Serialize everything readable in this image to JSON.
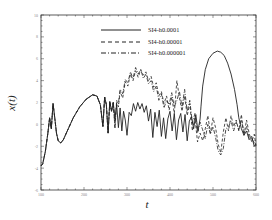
{
  "chart_data": {
    "type": "line",
    "title": "",
    "xlabel": "t",
    "ylabel": "x(t)",
    "xlim": [
      100,
      600
    ],
    "ylim": [
      -6,
      10
    ],
    "xticks": [
      100,
      200,
      300,
      400,
      500,
      600
    ],
    "yticks": [
      -6,
      -4,
      -2,
      0,
      2,
      4,
      6,
      8,
      10
    ],
    "grid": false,
    "legend_position": "upper center",
    "series": [
      {
        "name": "SI4-h0.0001",
        "style": "solid",
        "x": [
          100,
          104,
          110,
          116,
          120,
          124,
          128,
          132,
          136,
          140,
          146,
          152,
          160,
          175,
          190,
          205,
          220,
          230,
          238,
          244,
          248,
          252,
          256,
          260,
          264,
          268,
          272,
          276,
          280,
          284,
          288,
          292,
          296,
          300,
          305,
          310,
          315,
          320,
          325,
          330,
          335,
          340,
          345,
          350,
          355,
          360,
          365,
          370,
          375,
          380,
          385,
          390,
          395,
          400,
          405,
          410,
          415,
          420,
          425,
          430,
          435,
          440,
          445,
          450,
          455,
          460,
          465,
          470,
          472,
          476,
          482,
          490,
          500,
          510,
          518,
          526,
          534,
          542,
          550,
          556,
          560,
          566,
          572,
          578,
          584,
          590,
          596,
          600
        ],
        "y": [
          -3.8,
          -3.6,
          -2.5,
          -0.8,
          0.6,
          -0.4,
          1.9,
          0.6,
          -0.8,
          -1.5,
          -1.7,
          -1.4,
          -0.7,
          0.6,
          1.6,
          2.3,
          2.7,
          2.6,
          1.8,
          -0.2,
          2.5,
          1.8,
          -0.8,
          2.1,
          1.2,
          2.0,
          0.5,
          1.8,
          -0.3,
          1.5,
          -0.6,
          1.2,
          0.4,
          -1.0,
          1.1,
          0.8,
          1.9,
          1.2,
          2.0,
          1.4,
          1.9,
          1.1,
          1.7,
          0.3,
          1.4,
          -1.2,
          1.1,
          -0.2,
          1.3,
          -1.1,
          0.6,
          -1.3,
          0.5,
          1.2,
          -0.6,
          1.0,
          -1.4,
          0.4,
          1.0,
          -0.7,
          0.9,
          -1.5,
          0.3,
          0.7,
          -0.4,
          0.9,
          -0.6,
          0.5,
          1.6,
          3.5,
          5.0,
          6.0,
          6.5,
          6.7,
          6.6,
          6.3,
          5.6,
          4.6,
          3.2,
          1.8,
          0.6,
          -0.4,
          -1.0,
          -0.6,
          -1.4,
          -1.1,
          -2.0,
          -1.8
        ]
      },
      {
        "name": "SI4-h0.00001",
        "style": "dashed",
        "x": [
          100,
          104,
          110,
          116,
          120,
          124,
          128,
          132,
          136,
          140,
          146,
          152,
          160,
          175,
          190,
          205,
          220,
          230,
          238,
          244,
          248,
          252,
          256,
          260,
          264,
          268,
          272,
          276,
          280,
          284,
          290,
          296,
          302,
          308,
          314,
          320,
          326,
          332,
          338,
          344,
          350,
          356,
          362,
          368,
          374,
          380,
          386,
          392,
          398,
          404,
          410,
          416,
          422,
          428,
          434,
          440,
          446,
          452,
          458,
          464,
          470,
          476,
          482,
          488,
          494,
          500,
          506,
          512,
          518,
          524,
          530,
          536,
          542,
          548,
          554,
          560,
          566,
          572,
          578,
          584,
          590,
          596,
          600
        ],
        "y": [
          -3.8,
          -3.6,
          -2.5,
          -0.8,
          0.6,
          -0.4,
          1.9,
          0.6,
          -0.8,
          -1.5,
          -1.7,
          -1.4,
          -0.7,
          0.6,
          1.6,
          2.3,
          2.7,
          2.6,
          1.8,
          -0.2,
          2.5,
          1.8,
          -0.8,
          2.1,
          1.2,
          2.0,
          -0.3,
          2.2,
          1.6,
          3.0,
          2.4,
          3.9,
          3.5,
          4.6,
          4.0,
          4.9,
          4.3,
          5.0,
          4.5,
          4.8,
          4.0,
          4.4,
          3.4,
          3.8,
          2.6,
          3.0,
          1.9,
          2.6,
          1.3,
          2.5,
          1.0,
          4.0,
          2.4,
          1.2,
          2.6,
          0.8,
          1.9,
          -0.6,
          0.6,
          -1.6,
          -0.8,
          -1.5,
          -0.4,
          0.8,
          -0.8,
          0.6,
          -0.3,
          -1.8,
          -2.6,
          -0.7,
          0.6,
          -0.6,
          0.8,
          -0.2,
          0.4,
          -0.6,
          0.9,
          -1.0,
          0.4,
          -0.8,
          -1.6,
          -0.9,
          -2.0
        ]
      },
      {
        "name": "SI4-h0.000001",
        "style": "dashdot",
        "x": [
          100,
          104,
          110,
          116,
          120,
          124,
          128,
          132,
          136,
          140,
          146,
          152,
          160,
          175,
          190,
          205,
          220,
          230,
          238,
          244,
          248,
          252,
          256,
          260,
          264,
          268,
          272,
          276,
          280,
          284,
          290,
          296,
          302,
          308,
          314,
          320,
          326,
          332,
          338,
          344,
          350,
          356,
          362,
          368,
          374,
          380,
          386,
          392,
          398,
          404,
          410,
          416,
          422,
          428,
          434,
          440,
          446,
          452,
          458,
          464,
          470,
          476,
          482,
          488,
          494,
          500,
          506,
          512,
          518,
          524,
          530,
          536,
          542,
          548,
          554,
          560,
          566,
          572,
          578,
          584,
          590,
          596,
          600
        ],
        "y": [
          -3.8,
          -3.6,
          -2.5,
          -0.8,
          0.6,
          -0.4,
          1.9,
          0.6,
          -0.8,
          -1.5,
          -1.7,
          -1.4,
          -0.7,
          0.6,
          1.6,
          2.3,
          2.7,
          2.6,
          1.8,
          -0.2,
          2.5,
          1.8,
          -0.8,
          2.1,
          1.2,
          2.0,
          -0.3,
          2.0,
          1.9,
          3.2,
          2.8,
          4.1,
          3.8,
          4.8,
          4.2,
          5.2,
          4.6,
          5.0,
          4.2,
          4.6,
          3.7,
          4.0,
          3.0,
          3.5,
          2.2,
          2.8,
          1.5,
          2.2,
          1.8,
          2.9,
          1.6,
          2.2,
          3.0,
          1.6,
          3.2,
          1.2,
          2.2,
          0.1,
          1.0,
          -0.8,
          0.2,
          -0.5,
          -1.3,
          0.0,
          -0.9,
          -0.2,
          -1.2,
          -2.4,
          -2.8,
          -2.2,
          -0.4,
          -0.2,
          0.3,
          -0.6,
          0.2,
          -0.5,
          0.4,
          -0.8,
          -0.2,
          -1.2,
          -1.3,
          -1.7,
          -2.0
        ]
      }
    ]
  },
  "legend": {
    "items": [
      {
        "label": "SI4-h0.0001"
      },
      {
        "label": "SI4-h0.00001"
      },
      {
        "label": "SI4-h0.000001"
      }
    ]
  },
  "axes": {
    "xlabel": "t",
    "ylabel": "x(t)",
    "xtick_labels": [
      "100",
      "200",
      "300",
      "400",
      "500",
      "600"
    ],
    "ytick_labels": [
      "-6",
      "-4",
      "-2",
      "0",
      "2",
      "4",
      "6",
      "8",
      "10"
    ]
  }
}
